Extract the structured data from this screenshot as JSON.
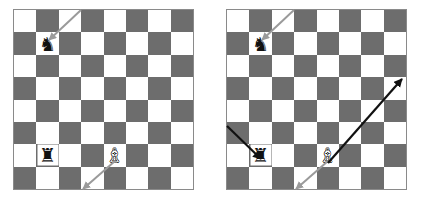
{
  "figure": {
    "board_size": 8,
    "colors": {
      "light_square": "#ffffff",
      "dark_square": "#6d6d6d",
      "border": "#8a8a8a",
      "gray_arrow": "#9a9a9a",
      "black_arrow": "#111111",
      "black_piece": "#111111",
      "white_piece": "#ffffff"
    }
  },
  "boards": [
    {
      "id": "board-left",
      "label": "left-board",
      "pieces": [
        {
          "name": "black-knight",
          "glyph": "♞",
          "color": "black",
          "row": 2,
          "col": 2,
          "square_shade": "light"
        },
        {
          "name": "black-rook",
          "glyph": "♜",
          "color": "black",
          "row": 7,
          "col": 2,
          "square_shade": "dark"
        },
        {
          "name": "white-bishop",
          "glyph": "♗",
          "color": "white",
          "row": 7,
          "col": 5,
          "square_shade": "light"
        }
      ],
      "arrows": [
        {
          "name": "gray-arrow-to-knight",
          "color": "#9a9a9a",
          "style": "gray",
          "from": {
            "x": 68,
            "y": 1
          },
          "to": {
            "x": 36,
            "y": 31
          }
        },
        {
          "name": "gray-arrow-from-bishop",
          "color": "#9a9a9a",
          "style": "gray",
          "from": {
            "x": 102,
            "y": 152
          },
          "to": {
            "x": 70,
            "y": 180
          }
        }
      ]
    },
    {
      "id": "board-right",
      "label": "right-board",
      "pieces": [
        {
          "name": "black-knight",
          "glyph": "♞",
          "color": "black",
          "row": 2,
          "col": 2,
          "square_shade": "light"
        },
        {
          "name": "black-rook",
          "glyph": "♜",
          "color": "black",
          "row": 7,
          "col": 2,
          "square_shade": "dark"
        },
        {
          "name": "white-bishop",
          "glyph": "♗",
          "color": "white",
          "row": 7,
          "col": 5,
          "square_shade": "light"
        }
      ],
      "arrows": [
        {
          "name": "gray-arrow-to-knight",
          "color": "#9a9a9a",
          "style": "gray",
          "from": {
            "x": 68,
            "y": 1
          },
          "to": {
            "x": 36,
            "y": 31
          }
        },
        {
          "name": "gray-arrow-from-bishop",
          "color": "#9a9a9a",
          "style": "gray",
          "from": {
            "x": 102,
            "y": 152
          },
          "to": {
            "x": 70,
            "y": 180
          }
        },
        {
          "name": "black-arrow-to-rook",
          "color": "#111111",
          "style": "black",
          "from": {
            "x": 1,
            "y": 117
          },
          "to": {
            "x": 35,
            "y": 150
          }
        },
        {
          "name": "black-arrow-from-bishop",
          "color": "#111111",
          "style": "black",
          "from": {
            "x": 102,
            "y": 154
          },
          "to": {
            "x": 176,
            "y": 70
          }
        }
      ]
    }
  ]
}
